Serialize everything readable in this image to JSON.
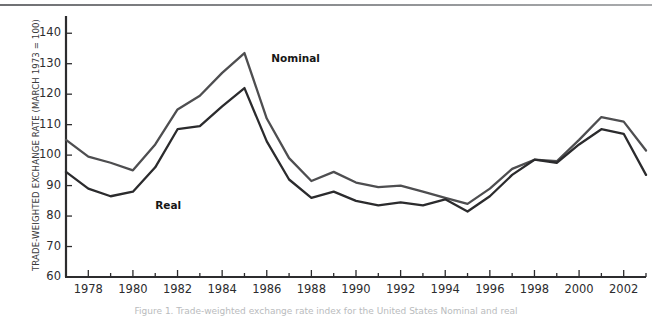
{
  "figure": {
    "ylabel": "TRADE-WEIGHTED EXCHANGE RATE (MARCH 1973 = 100)",
    "caption": "Figure 1. Trade-weighted exchange rate index for the United States Nominal and real",
    "nominal_label": "Nominal",
    "real_label": "Real",
    "line_color_nominal": "#4e4e50",
    "line_color_real": "#2b2b2d",
    "axis_color": "#2c2c2e",
    "background": "#ffffff"
  },
  "chart_data": {
    "type": "line",
    "title": "",
    "xlabel": "",
    "ylabel": "TRADE-WEIGHTED EXCHANGE RATE (MARCH 1973 = 100)",
    "xlim": [
      1977,
      2003
    ],
    "ylim": [
      60,
      145
    ],
    "yticks": [
      60,
      70,
      80,
      90,
      100,
      110,
      120,
      130,
      140
    ],
    "xticks": [
      1977,
      1978,
      1979,
      1980,
      1981,
      1982,
      1983,
      1984,
      1985,
      1986,
      1987,
      1988,
      1989,
      1990,
      1991,
      1992,
      1993,
      1994,
      1995,
      1996,
      1997,
      1998,
      1999,
      2000,
      2001,
      2002,
      2003
    ],
    "xtick_labels": [
      "1978",
      "1980",
      "1982",
      "1984",
      "1986",
      "1988",
      "1990",
      "1992",
      "1994",
      "1996",
      "1998",
      "2000",
      "2002"
    ],
    "xtick_labels_years": [
      1978,
      1980,
      1982,
      1984,
      1986,
      1988,
      1990,
      1992,
      1994,
      1996,
      1998,
      2000,
      2002
    ],
    "grid": false,
    "legend": "inline-annotations",
    "x": [
      1977,
      1978,
      1979,
      1980,
      1981,
      1982,
      1983,
      1984,
      1985,
      1986,
      1987,
      1988,
      1989,
      1990,
      1991,
      1992,
      1993,
      1994,
      1995,
      1996,
      1997,
      1998,
      1999,
      2000,
      2001,
      2002,
      2003
    ],
    "series": [
      {
        "name": "Nominal",
        "color": "#4e4e50",
        "values": [
          105.0,
          99.5,
          97.5,
          95.0,
          103.5,
          115.0,
          119.5,
          127.0,
          133.5,
          112.0,
          99.0,
          91.5,
          94.5,
          91.0,
          89.5,
          90.0,
          88.0,
          86.0,
          84.0,
          89.0,
          95.5,
          98.5,
          98.0,
          105.0,
          112.5,
          111.0,
          101.5
        ]
      },
      {
        "name": "Real",
        "color": "#2b2b2d",
        "values": [
          94.5,
          89.0,
          86.5,
          88.0,
          96.0,
          108.5,
          109.5,
          116.0,
          122.0,
          104.5,
          92.0,
          86.0,
          88.0,
          85.0,
          83.5,
          84.5,
          83.5,
          85.5,
          81.5,
          86.5,
          93.5,
          98.5,
          97.5,
          103.5,
          108.5,
          107.0,
          93.5
        ]
      }
    ],
    "annotations": [
      {
        "text": "Nominal",
        "x": 1986.2,
        "y": 132.0
      },
      {
        "text": "Real",
        "x": 1981.0,
        "y": 83.5
      }
    ]
  }
}
